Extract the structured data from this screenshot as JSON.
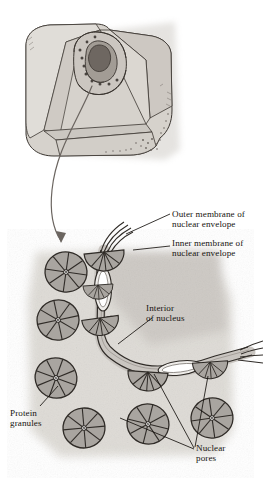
{
  "figure": {
    "style": "pen-and-ink textbook illustration, grayscale"
  },
  "labels": {
    "outer_membrane": "Outer membrane of\nnuclear envelope",
    "inner_membrane": "Inner membrane of\nnuclear envelope",
    "interior": "Interior\nof nucleus",
    "protein_granules": "Protein\ngranules",
    "nuclear_pores": "Nuclear\npores"
  },
  "colors": {
    "ink": "#16130f",
    "outline": "#3b3631",
    "granule_fill": "#a9a5a0",
    "granule_shadow": "#8d8984",
    "membrane_fill": "#c9c5c0",
    "cell_fill": "#d6d2cc",
    "cell_shadow": "#b5b0aa",
    "nucleus_fill": "#a29c95",
    "nucleolus_fill": "#6e6761",
    "background_wash": "#dedbd6",
    "arrow": "#6b6560",
    "page": "#ffffff"
  },
  "structures": {
    "cell_block": "cutaway cell block with nucleus",
    "nucleolus": "dark interior body",
    "zoom_arrow": "curved arrow from cell to magnified detail",
    "envelope_path": "L-shaped double membrane ribbon",
    "pore_count_in_membrane": 5,
    "free_granule_count": 6,
    "granule_wedges": 8
  },
  "leaders": {
    "outer_membrane": "line from label left to upper membrane end",
    "inner_membrane": "line from label left to inner membrane layer",
    "interior": "line from label down-left into nucleus interior",
    "protein_granules": "line from label up-right to a granule",
    "nuclear_pores": "three lines fanning up-left to pores"
  }
}
